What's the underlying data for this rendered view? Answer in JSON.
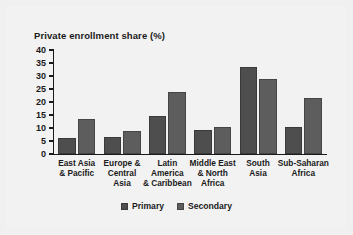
{
  "chart_data": {
    "type": "bar",
    "title": "Private enrollment share (%)",
    "xlabel": "",
    "ylabel": "",
    "ylim": [
      0,
      40
    ],
    "yticks": [
      0,
      5,
      10,
      15,
      20,
      25,
      30,
      35,
      40
    ],
    "ytick_labels": [
      "0",
      "5",
      "10",
      "15",
      "20",
      "25",
      "30",
      "35",
      "40"
    ],
    "grid": false,
    "legend_position": "bottom",
    "categories": [
      "East Asia\n& Pacific",
      "Europe &\nCentral\nAsia",
      "Latin\nAmerica\n& Caribbean",
      "Middle East\n& North\nAfrica",
      "South\nAsia",
      "Sub-Saharan\nAfrica"
    ],
    "series": [
      {
        "name": "Primary",
        "color": "#4e4e4e",
        "values": [
          6.0,
          6.5,
          14.8,
          9.3,
          33.5,
          10.4
        ]
      },
      {
        "name": "Secondary",
        "color": "#5d5d5d",
        "values": [
          13.6,
          8.8,
          23.8,
          10.4,
          28.8,
          21.4
        ]
      }
    ]
  }
}
